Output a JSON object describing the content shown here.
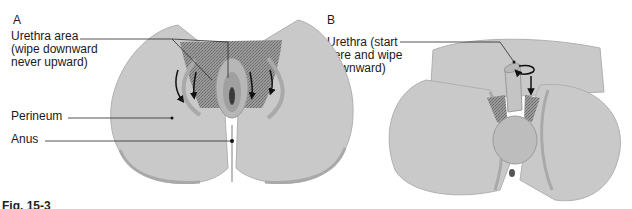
{
  "panels": {
    "a": {
      "letter": "A",
      "labels": {
        "urethra": "Urethra area\n(wipe downward\nnever upward)",
        "perineum": "Perineum",
        "anus": "Anus"
      }
    },
    "b": {
      "letter": "B",
      "labels": {
        "urethra": "Urethra (start\nhere and wipe\ndownward)"
      }
    }
  },
  "caption": "Fig. 15-3",
  "colors": {
    "skin": "#c9c9c9",
    "skin_shadow": "#a9a9a9",
    "hair": "#8a8a8a",
    "line": "#2a2a2a"
  }
}
